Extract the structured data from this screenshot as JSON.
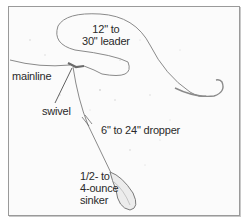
{
  "diagram": {
    "type": "fishing-rig-illustration",
    "labels": {
      "leader_line1": "12\" to",
      "leader_line2": "30\" leader",
      "mainline": "mainline",
      "swivel": "swivel",
      "dropper": "6\" to 24\" dropper",
      "sinker_line1": "1/2- to",
      "sinker_line2": "4-ounce",
      "sinker_line3": "sinker"
    },
    "components": [
      "mainline",
      "swivel",
      "leader",
      "hook",
      "dropper",
      "sinker"
    ],
    "colors": {
      "line": "#8a8a8a",
      "text": "#2a2a2a",
      "frame": "#9a9a9a",
      "background": "#fbfbfb"
    }
  }
}
